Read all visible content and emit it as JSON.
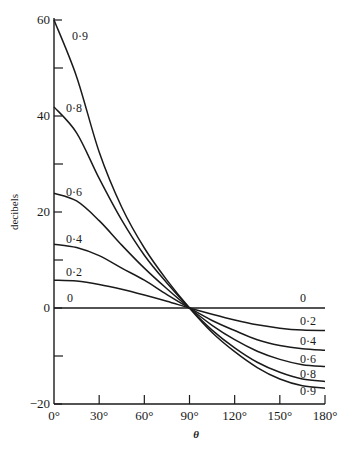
{
  "chart_data": {
    "type": "line",
    "title": "",
    "xlabel": "θ",
    "ylabel": "decibels",
    "xlim": [
      0,
      180
    ],
    "ylim": [
      -20,
      60
    ],
    "x_ticks": [
      0,
      30,
      60,
      90,
      120,
      150,
      180
    ],
    "x_tick_labels": [
      "0°",
      "30°",
      "60°",
      "90°",
      "120°",
      "150°",
      "180°"
    ],
    "y_ticks": [
      -20,
      0,
      20,
      40,
      60
    ],
    "y_tick_labels": [
      "−20",
      "0",
      "20",
      "40",
      "60"
    ],
    "y_minor_ticks": [
      -10,
      10,
      30,
      50
    ],
    "grid": false,
    "x": [
      0,
      15,
      30,
      45,
      60,
      75,
      90,
      105,
      120,
      135,
      150,
      165,
      180
    ],
    "series": [
      {
        "name": "0",
        "label_left": "0",
        "label_right": "0",
        "values": [
          0,
          0,
          0,
          0,
          0,
          0,
          0,
          0,
          0,
          0,
          0,
          0,
          0
        ]
      },
      {
        "name": "0·2",
        "label_left": "0·2",
        "label_right": "0·2",
        "values": [
          5.8,
          5.6,
          4.9,
          3.9,
          2.7,
          1.4,
          0,
          -1.3,
          -2.5,
          -3.5,
          -4.2,
          -4.6,
          -4.7
        ]
      },
      {
        "name": "0·4",
        "label_left": "0·4",
        "label_right": "0·4",
        "values": [
          13.3,
          12.6,
          10.9,
          8.3,
          5.8,
          2.8,
          0,
          -2.6,
          -4.7,
          -6.6,
          -7.8,
          -8.5,
          -8.8
        ]
      },
      {
        "name": "0·6",
        "label_left": "0·6",
        "label_right": "0·6",
        "values": [
          23.9,
          22.3,
          18.2,
          13.1,
          8.3,
          4.0,
          0,
          -3.6,
          -6.6,
          -9.0,
          -10.7,
          -11.8,
          -12.2
        ]
      },
      {
        "name": "0·8",
        "label_left": "0·8",
        "label_right": "0·8",
        "values": [
          41.9,
          36.5,
          27.0,
          18.3,
          11.0,
          5.2,
          0,
          -4.6,
          -8.3,
          -11.3,
          -13.4,
          -14.8,
          -15.3
        ]
      },
      {
        "name": "0·9",
        "label_left": "0·9",
        "label_right": "0·9",
        "values": [
          60.0,
          48.2,
          32.5,
          21.0,
          12.5,
          5.8,
          0,
          -5.1,
          -9.1,
          -12.4,
          -14.8,
          -16.2,
          -16.7
        ]
      }
    ]
  }
}
